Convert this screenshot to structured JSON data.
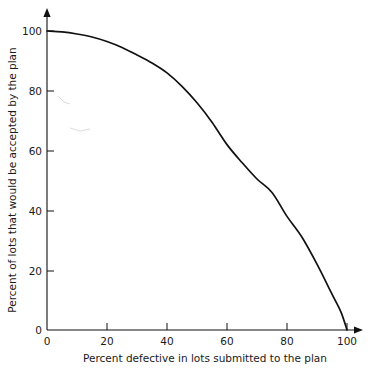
{
  "chart_data": {
    "type": "line",
    "title": "",
    "subtitle": "",
    "xlabel": "Percent defective in lots submitted to the plan",
    "ylabel": "Percent of lots that would be accepted by the plan",
    "xlim": [
      0,
      100
    ],
    "ylim": [
      0,
      100
    ],
    "xticks": [
      "0",
      "20",
      "40",
      "60",
      "80",
      "100"
    ],
    "xtick_values": [
      0,
      20,
      40,
      60,
      80,
      100
    ],
    "yticks": [
      "0",
      "20",
      "40",
      "60",
      "80",
      "100"
    ],
    "ytick_values": [
      0,
      20,
      40,
      60,
      80,
      100
    ],
    "grid": false,
    "legend": null,
    "legend_position": "none",
    "series": [
      {
        "name": "Operating characteristic curve",
        "color": "#111111",
        "x": [
          0,
          5,
          10,
          15,
          20,
          25,
          30,
          35,
          40,
          45,
          50,
          55,
          60,
          65,
          70,
          75,
          80,
          85,
          90,
          95,
          98,
          100
        ],
        "y": [
          100,
          99.7,
          99,
          98,
          96.5,
          94.5,
          92,
          89.3,
          86,
          81.5,
          76,
          69.5,
          62,
          56,
          50.5,
          46,
          38,
          31,
          22,
          12,
          6,
          0
        ]
      }
    ],
    "annotations": []
  },
  "axes": {
    "x_axis_name": "x-axis",
    "y_axis_name": "y-axis",
    "x_arrow": true,
    "y_arrow": true
  }
}
